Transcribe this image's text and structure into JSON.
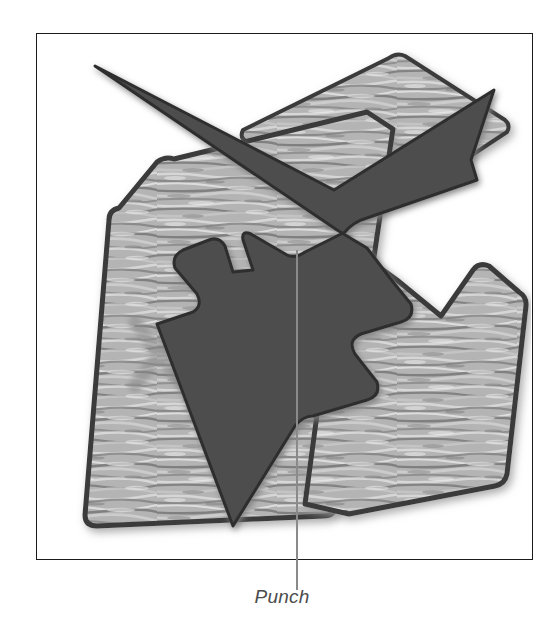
{
  "figure": {
    "caption": "Punch",
    "leader_line": {
      "name": "leader-line",
      "color": "#8a8a8a",
      "x": 296,
      "y_top": 250,
      "y_bottom": 590
    },
    "frame": {
      "border_color": "#1b1b1b",
      "background": "#ffffff",
      "x": 36,
      "y": 33,
      "width": 497,
      "height": 527
    },
    "colors": {
      "punch_fill": "#4d4d4d",
      "punch_edge": "#2e2e2e",
      "wood_light": "#cfcfcf",
      "wood_mid": "#a8a8a8",
      "wood_dark": "#6f6f6f",
      "wood_edge": "#3a3a3a",
      "wood_shadow": "#b9b9b9",
      "x_mark": "#8e8e8e",
      "page_background": "#ffffff"
    },
    "marks": [
      {
        "name": "x-mark",
        "label": "X",
        "color": "#8e8e8e"
      }
    ],
    "parts": [
      {
        "name": "workpiece-top-right",
        "material": "wood"
      },
      {
        "name": "workpiece-bottom-left",
        "material": "wood"
      },
      {
        "name": "workpiece-bottom-right",
        "material": "wood"
      },
      {
        "name": "punch-tool",
        "material": "steel"
      }
    ]
  }
}
